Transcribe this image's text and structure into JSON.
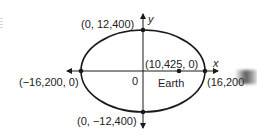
{
  "diagram": {
    "axes": {
      "x_label": "x",
      "y_label": "y",
      "origin_label": "0"
    },
    "points": {
      "top_vertex": "(0, 12,400)",
      "bottom_vertex": "(0, −12,400)",
      "left_vertex": "(−16,200, 0)",
      "right_vertex": "(16,200",
      "focus": "(10,425, 0)"
    },
    "focus_name": "Earth",
    "geometry": {
      "center_px": [
        143,
        71
      ],
      "rx_px": 62,
      "ry_px": 41,
      "focus_px": [
        179,
        71
      ]
    },
    "colors": {
      "stroke": "#1a1a1a",
      "text": "#222222",
      "background": "#ffffff"
    }
  }
}
